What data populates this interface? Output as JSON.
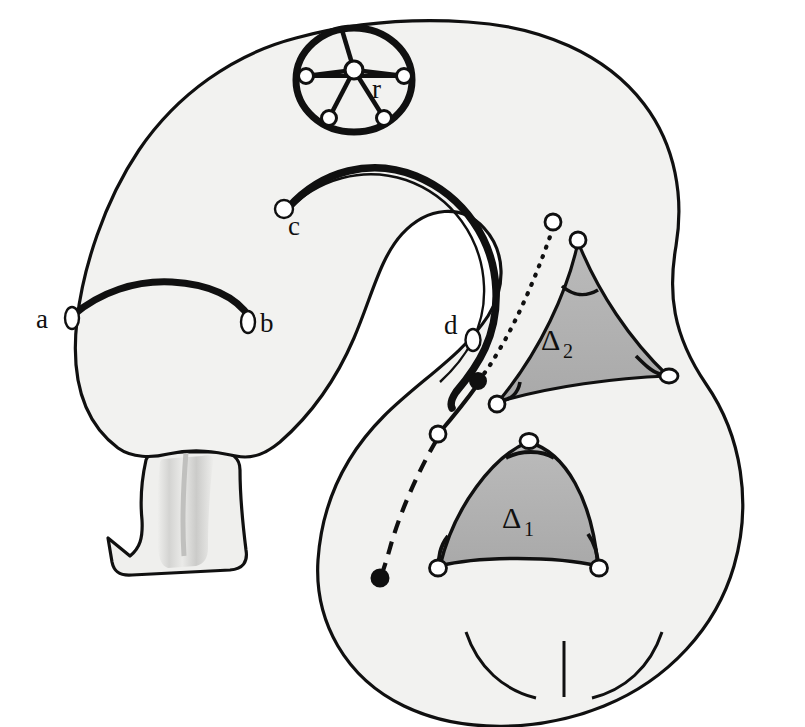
{
  "figure": {
    "background_color": "#ffffff",
    "surface_fill": "#f2f2f0",
    "surface_stroke": "#101010",
    "triangle_fill": "#b3b3b3",
    "triangle_stroke": "#101010",
    "stalk_fill": "#e8e8e6",
    "stalk_shadow": "#c9c9c7",
    "vertex_fill": "#ffffff",
    "vertex_stroke": "#101010",
    "filled_dot_color": "#101010"
  },
  "labels": {
    "a": "a",
    "b": "b",
    "c": "c",
    "d": "d",
    "r": "r",
    "delta1": "Δ",
    "delta1_sub": "1",
    "delta2": "Δ",
    "delta2_sub": "2"
  },
  "arcs": [
    {
      "name": "arc-ab",
      "from": "a",
      "to": "b",
      "style": "solid-thick"
    },
    {
      "name": "arc-cd",
      "from": "c",
      "to": "d",
      "style": "solid-thick"
    },
    {
      "name": "path-dotted-dashed",
      "style": "mixed-dotted-solid-dashed",
      "endpoints": [
        "filled-dot",
        "open-circle"
      ]
    }
  ],
  "wheel": {
    "name": "wheel-graph-r",
    "label": "r",
    "hub_count": 1,
    "rim_vertex_count": 5,
    "spoke_count": 5
  },
  "triangles": [
    {
      "name": "triangle-delta-1",
      "label": "Δ1",
      "vertex_count": 3,
      "side_curvature": "convex",
      "angle_arc_count": 3
    },
    {
      "name": "triangle-delta-2",
      "label": "Δ2",
      "vertex_count": 3,
      "side_curvature": "concave",
      "angle_arc_count": 3
    }
  ],
  "vertices": {
    "open_circle_count": 16,
    "filled_dot_count": 2
  }
}
